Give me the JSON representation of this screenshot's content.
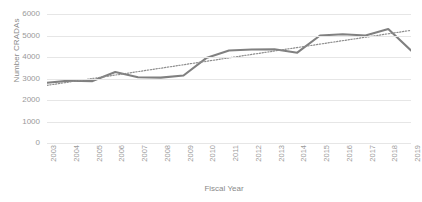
{
  "chart_data": {
    "type": "line",
    "title": "",
    "xlabel": "Fiscal Year",
    "ylabel": "Number CRADAs",
    "categories": [
      "2003",
      "2004",
      "2005",
      "2006",
      "2007",
      "2008",
      "2009",
      "2010",
      "2011",
      "2012",
      "2013",
      "2014",
      "2015",
      "2016",
      "2017",
      "2018",
      "2019"
    ],
    "ylim": [
      0,
      6000
    ],
    "yticks": [
      0,
      1000,
      2000,
      3000,
      4000,
      5000,
      6000
    ],
    "ytick_labels": [
      "0",
      "1000",
      "2000",
      "3000",
      "4000",
      "5000",
      "6000"
    ],
    "grid": true,
    "legend": "none",
    "series": [
      {
        "name": "Number CRADAs",
        "style": "solid",
        "color": "#808080",
        "values": [
          2800,
          2900,
          2880,
          3300,
          3060,
          3040,
          3140,
          3950,
          4300,
          4350,
          4360,
          4200,
          5000,
          5060,
          5000,
          5300,
          4300
        ]
      },
      {
        "name": "Linear trendline",
        "style": "dotted",
        "color": "#8c8c8c",
        "values": [
          2680,
          2840,
          3000,
          3160,
          3320,
          3480,
          3640,
          3800,
          3960,
          4120,
          4280,
          4440,
          4600,
          4760,
          4920,
          5080,
          5240
        ]
      }
    ]
  },
  "axes": {
    "ylabel": "Number CRADAs",
    "xlabel": "Fiscal Year"
  },
  "colors": {
    "series": "#808080",
    "trendline": "#8c8c8c",
    "grid": "#e6e6e6",
    "text": "#9a9a9a",
    "background": "#ffffff"
  }
}
